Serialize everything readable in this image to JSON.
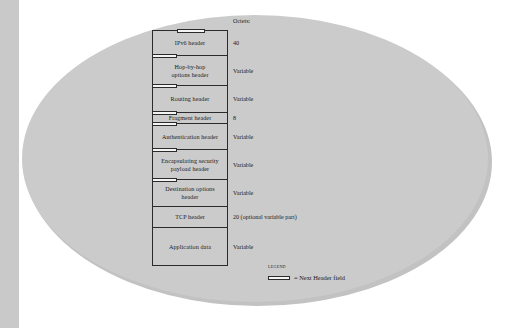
{
  "figure": {
    "octets_column_title": "Octets:",
    "rows": [
      {
        "label": "IPv6 header",
        "octets": "40",
        "marker": "top-center",
        "height": 26
      },
      {
        "label": "Hop-by-hop\noptions header",
        "octets": "Variable",
        "marker": "top-left",
        "height": 30
      },
      {
        "label": "Routing header",
        "octets": "Variable",
        "marker": "top-left",
        "height": 27
      },
      {
        "label": "Fragment header",
        "octets": "8",
        "marker": "frag-left",
        "height": 11
      },
      {
        "label": "Authentication header",
        "octets": "Variable",
        "marker": "top-left",
        "height": 26
      },
      {
        "label": "Encapsulating security\npayload header",
        "octets": "Variable",
        "marker": "top-left",
        "height": 30
      },
      {
        "label": "Destination options\nheader",
        "octets": "Variable",
        "marker": "top-left",
        "height": 27
      },
      {
        "label": "TCP header",
        "octets": "20 (optional variable part)",
        "marker": "none",
        "height": 21
      },
      {
        "label": "Application data",
        "octets": "Variable",
        "marker": "none",
        "height": 38
      }
    ],
    "legend": {
      "title": "Legend",
      "swatch_name": "next-header-field-swatch",
      "text": "= Next Header field"
    },
    "colors": {
      "oval_fill": "#cbcbcb",
      "oval_shadow": "#c2c2c2",
      "left_bar": "#c9c9c9",
      "line": "#2b2b2b",
      "marker_fill": "#f4f4f4"
    }
  }
}
